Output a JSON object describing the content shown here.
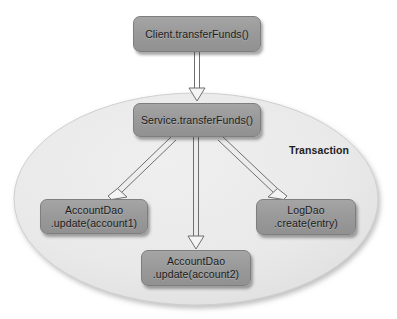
{
  "diagram": {
    "title_label": "Transaction",
    "background_color": "#ffffff",
    "node_fill_color": "#9a9a9a",
    "node_border_color": "#7e7e7e",
    "ellipse_fill_color": "#e8e8e8",
    "arrow_stroke_color": "#6f6f6f",
    "arrow_fill_color": "#f2f2f2",
    "boundary": {
      "name": "Transaction",
      "shape": "ellipse",
      "label": "Transaction"
    },
    "nodes": [
      {
        "id": "client",
        "line1": "Client.transferFunds()",
        "line2": ""
      },
      {
        "id": "service",
        "line1": "Service.transferFunds()",
        "line2": ""
      },
      {
        "id": "account1",
        "line1": "AccountDao",
        "line2": ".update(account1)"
      },
      {
        "id": "logdao",
        "line1": "LogDao",
        "line2": ".create(entry)"
      },
      {
        "id": "account2",
        "line1": "AccountDao",
        "line2": ".update(account2)"
      }
    ],
    "edges": [
      {
        "id": "client-to-service",
        "from": "Client.transferFunds()",
        "to": "Service.transferFunds()",
        "style": "open-arrow"
      },
      {
        "id": "service-to-account1",
        "from": "Service.transferFunds()",
        "to": "AccountDao.update(account1)",
        "style": "open-arrow"
      },
      {
        "id": "service-to-account2",
        "from": "Service.transferFunds()",
        "to": "AccountDao.update(account2)",
        "style": "open-arrow"
      },
      {
        "id": "service-to-logdao",
        "from": "Service.transferFunds()",
        "to": "LogDao.create(entry)",
        "style": "open-arrow"
      }
    ]
  }
}
